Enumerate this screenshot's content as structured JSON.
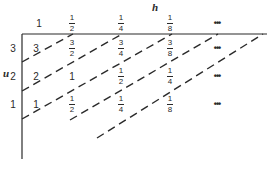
{
  "diagram": {
    "axis_top_label": "h",
    "axis_left_label": "u",
    "column_headers": [
      {
        "text": "1",
        "x": 39
      },
      {
        "num": "1",
        "den": "2",
        "x": 72
      },
      {
        "num": "1",
        "den": "4",
        "x": 121
      },
      {
        "num": "1",
        "den": "8",
        "x": 170
      },
      {
        "dots": "•••",
        "x": 217
      }
    ],
    "row_headers": [
      {
        "text": "3",
        "y": 44
      },
      {
        "text": "2",
        "y": 72
      },
      {
        "text": "1",
        "y": 100
      }
    ],
    "cells": [
      [
        {
          "text": "3",
          "x": 36
        },
        {
          "num": "3",
          "den": "2",
          "x": 72
        },
        {
          "num": "3",
          "den": "4",
          "x": 121
        },
        {
          "num": "3",
          "den": "8",
          "x": 170
        },
        {
          "dots": "•••",
          "x": 217
        }
      ],
      [
        {
          "text": "2",
          "x": 36
        },
        {
          "text": "1",
          "x": 72
        },
        {
          "num": "1",
          "den": "2",
          "x": 121
        },
        {
          "num": "1",
          "den": "4",
          "x": 170
        },
        {
          "dots": "•••",
          "x": 217
        }
      ],
      [
        {
          "text": "1",
          "x": 36
        },
        {
          "num": "1",
          "den": "2",
          "x": 72
        },
        {
          "num": "1",
          "den": "4",
          "x": 121
        },
        {
          "num": "1",
          "den": "8",
          "x": 170
        },
        {
          "dots": "•••",
          "x": 217
        }
      ]
    ],
    "dashed_lines": [
      {
        "x1": 22,
        "y1": 62,
        "x2": 73,
        "y2": 34
      },
      {
        "x1": 22,
        "y1": 91,
        "x2": 122,
        "y2": 34
      },
      {
        "x1": 22,
        "y1": 119,
        "x2": 172,
        "y2": 34
      },
      {
        "x1": 70,
        "y1": 120,
        "x2": 218,
        "y2": 34
      },
      {
        "x1": 97,
        "y1": 138,
        "x2": 263,
        "y2": 34
      }
    ],
    "colors": {
      "ink": "#2a2a2a",
      "background": "#ffffff"
    }
  }
}
